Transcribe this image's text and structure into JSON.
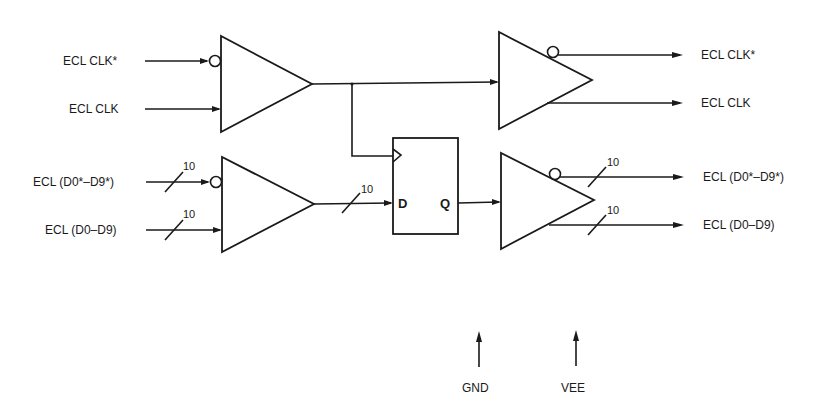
{
  "diagram": {
    "type": "ECL clock and data buffer/register block diagram",
    "inputs": {
      "clk_inv": "ECL CLK*",
      "clk": "ECL CLK",
      "data_inv": "ECL (D0*–D9*)",
      "data": "ECL (D0–D9)"
    },
    "outputs": {
      "clk_inv": "ECL CLK*",
      "clk": "ECL CLK",
      "data_inv": "ECL (D0*–D9*)",
      "data": "ECL (D0–D9)"
    },
    "bus_width": "10",
    "flipflop": {
      "d_pin": "D",
      "q_pin": "Q"
    },
    "power": {
      "gnd": "GND",
      "vee": "VEE"
    },
    "colors": {
      "ink": "#1a1a1a",
      "background": "#ffffff"
    }
  }
}
